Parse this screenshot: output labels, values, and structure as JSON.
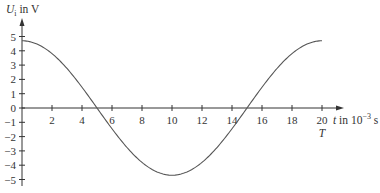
{
  "chart_data": {
    "type": "line",
    "title": "",
    "ylabel": "U_i in V",
    "ylabel_parts": {
      "symbol": "U",
      "subscript": "i",
      "unit": " in V"
    },
    "xlabel": "t in 10^-3 s",
    "xlabel_parts": {
      "symbol": "t",
      "unit": " in 10",
      "exponent": "−3",
      "suffix": " s"
    },
    "x_annotation": {
      "x": 20,
      "text": "T"
    },
    "xlim": [
      0,
      20
    ],
    "ylim": [
      -5,
      5
    ],
    "x_ticks": [
      2,
      4,
      6,
      8,
      10,
      12,
      14,
      16,
      18,
      20
    ],
    "x_tick_labels": [
      "2",
      "4",
      "6",
      "8",
      "10",
      "12",
      "14",
      "16",
      "18",
      "20"
    ],
    "y_ticks": [
      5,
      4,
      3,
      2,
      1,
      0,
      -1,
      -2,
      -3,
      -4,
      -5
    ],
    "y_tick_labels": [
      "5",
      "4",
      "3",
      "2",
      "1",
      "0",
      "−1",
      "−2",
      "−3",
      "−4",
      "−5"
    ],
    "grid": false,
    "legend": null,
    "series": [
      {
        "name": "U_i(t)",
        "description": "cosine, amplitude ≈ 4.7 V, period T = 20 ms",
        "x": [
          0,
          1,
          2,
          3,
          4,
          5,
          6,
          7,
          8,
          9,
          10,
          11,
          12,
          13,
          14,
          15,
          16,
          17,
          18,
          19,
          20
        ],
        "values": [
          4.7,
          4.64,
          4.47,
          4.19,
          3.8,
          3.32,
          2.76,
          2.13,
          1.45,
          0.74,
          0.0,
          -0.74,
          -1.45,
          -2.13,
          -2.76,
          -3.32,
          -3.8,
          -4.19,
          -4.47,
          -4.64,
          -4.7
        ]
      }
    ],
    "curve_points": {
      "t": [
        0,
        1,
        2,
        3,
        4,
        5,
        6,
        7,
        8,
        9,
        10,
        11,
        12,
        13,
        14,
        15,
        16,
        17,
        18,
        19,
        20
      ],
      "u": [
        4.7,
        4.47,
        3.8,
        2.76,
        1.45,
        0.0,
        -1.45,
        -2.76,
        -3.8,
        -4.47,
        -4.7,
        -4.47,
        -3.8,
        -2.76,
        -1.45,
        0.0,
        1.45,
        2.76,
        3.8,
        4.47,
        4.7
      ]
    },
    "colors": {
      "axis": "#333333",
      "curve": "#555555"
    }
  }
}
